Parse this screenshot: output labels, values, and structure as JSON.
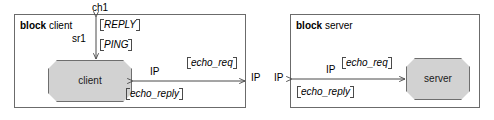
{
  "diagram": {
    "type": "block-communication-diagram",
    "blocks": [
      {
        "keyword": "block",
        "name": "client",
        "part_label": "client",
        "internal_connector_label": "IP",
        "ports": [
          "ch1",
          "sr1"
        ],
        "guards": [
          "[REPLY]",
          "[PING]"
        ],
        "messages": [
          "[ echo_req ]",
          "[ echo_reply ]"
        ]
      },
      {
        "keyword": "block",
        "name": "server",
        "part_label": "server",
        "internal_connector_label": "IP",
        "guards": [],
        "messages": [
          "[ echo_req ]",
          "[ echo_reply ]"
        ]
      }
    ],
    "client_block": {
      "keyword": "block",
      "name": "client",
      "part_name": "client",
      "top_port_label": "ch1",
      "left_port_label": "sr1",
      "guard_reply": "REPLY",
      "guard_ping": "PING",
      "ip_label": "IP",
      "msg_echo_req": "echo_req",
      "msg_echo_reply": "echo_reply",
      "boundary_ip_label": "IP"
    },
    "server_block": {
      "keyword": "block",
      "name": "server",
      "part_name": "server",
      "ip_label": "IP",
      "msg_echo_req": "echo_req",
      "msg_echo_reply": "echo_reply",
      "boundary_ip_label": "IP"
    },
    "colors": {
      "part_fill": "#d2d2d2",
      "part_stroke": "#6e6e6e",
      "frame_stroke": "#6b6b6b",
      "line_stroke": "#4a4a4a",
      "text": "#000000",
      "background": "#ffffff"
    }
  }
}
